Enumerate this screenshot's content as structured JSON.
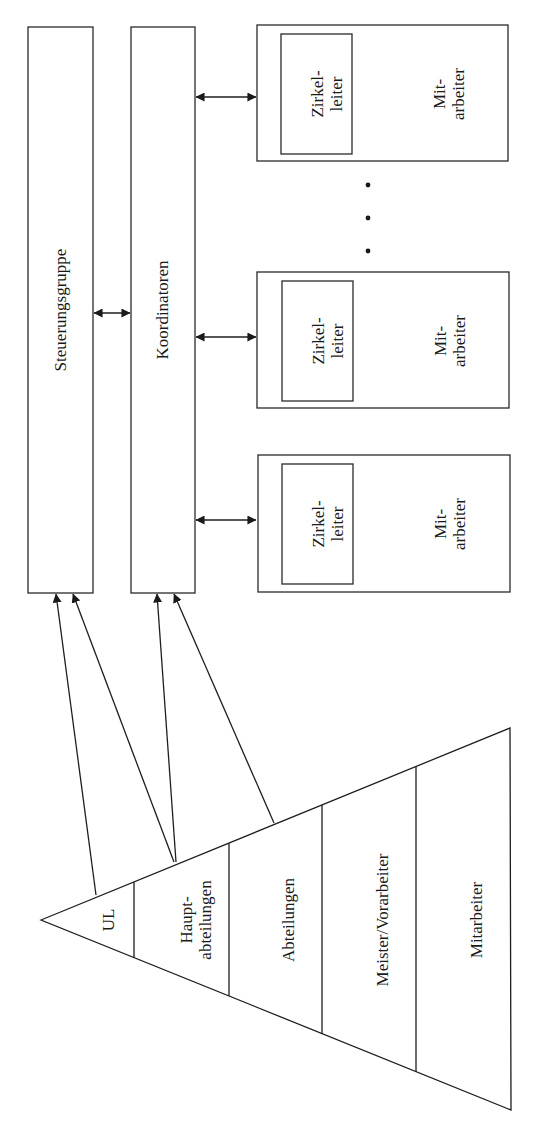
{
  "diagram": {
    "orientation": "rotated-90-ccw",
    "colors": {
      "stroke": "#1e1e1e",
      "text": "#1a1a1a",
      "background": "#ffffff"
    },
    "top_boxes": {
      "steering_group": {
        "label": "Steuerungsgruppe"
      },
      "coordinators": {
        "label": "Koordinatoren"
      }
    },
    "circles": [
      {
        "leader_line1": "Zirkel-",
        "leader_line2": "leiter",
        "members_line1": "Mit-",
        "members_line2": "arbeiter"
      },
      {
        "leader_line1": "Zirkel-",
        "leader_line2": "leiter",
        "members_line1": "Mit-",
        "members_line2": "arbeiter"
      },
      {
        "leader_line1": "Zirkel-",
        "leader_line2": "leiter",
        "members_line1": "Mit-",
        "members_line2": "arbeiter"
      }
    ],
    "ellipsis": "• • •",
    "hierarchy": {
      "levels": [
        {
          "label": "UL"
        },
        {
          "label_line1": "Haupt-",
          "label_line2": "abteilungen"
        },
        {
          "label": "Abteilungen"
        },
        {
          "label": "Meister/Vorarbeiter"
        },
        {
          "label": "Mitarbeiter"
        }
      ]
    },
    "connections": [
      {
        "from": "UL",
        "to": "Steuerungsgruppe"
      },
      {
        "from": "Hauptabteilungen",
        "to": "Steuerungsgruppe"
      },
      {
        "from": "Hauptabteilungen",
        "to": "Koordinatoren"
      },
      {
        "from": "Abteilungen",
        "to": "Koordinatoren"
      },
      {
        "from": "Steuerungsgruppe",
        "to": "Koordinatoren",
        "bidirectional": true
      },
      {
        "from": "Koordinatoren",
        "to": "Zirkel 1",
        "bidirectional": true
      },
      {
        "from": "Koordinatoren",
        "to": "Zirkel 2",
        "bidirectional": true
      },
      {
        "from": "Koordinatoren",
        "to": "Zirkel 3",
        "bidirectional": true
      }
    ]
  }
}
